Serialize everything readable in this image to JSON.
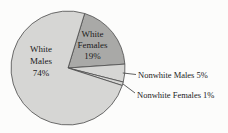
{
  "figure": {
    "background": "#fcfcfb",
    "stroke_color": "#4a4a4a",
    "leader_line_color": "#3a3a3a",
    "text_color": "#1b1b1b"
  },
  "chart_data": {
    "type": "pie",
    "title": "",
    "categories": [
      "White Males",
      "White Females",
      "Nonwhite Males",
      "Nonwhite Females"
    ],
    "values": [
      74,
      19,
      5,
      1
    ],
    "unit": "%",
    "legend": "none",
    "layout": {
      "center_x": 68,
      "center_y": 68,
      "radius": 57,
      "start_angle_deg": 73,
      "direction": "clockwise",
      "draw_order": [
        1,
        2,
        3,
        0
      ]
    },
    "slices": [
      {
        "label": "White Males",
        "pct": 74,
        "color": "#d6d6d4",
        "label_placement": "inside",
        "lines": [
          "White",
          "Males",
          "74%"
        ]
      },
      {
        "label": "White Females",
        "pct": 19,
        "color": "#a9a9a7",
        "label_placement": "inside",
        "lines": [
          "White",
          "Females",
          "19%"
        ]
      },
      {
        "label": "Nonwhite Males",
        "pct": 5,
        "color": "#d6d6d4",
        "label_placement": "outside",
        "callout": "Nonwhite Males 5%"
      },
      {
        "label": "Nonwhite Females",
        "pct": 1,
        "color": "#d6d6d4",
        "label_placement": "outside",
        "callout": "Nonwhite Females 1%"
      }
    ]
  }
}
